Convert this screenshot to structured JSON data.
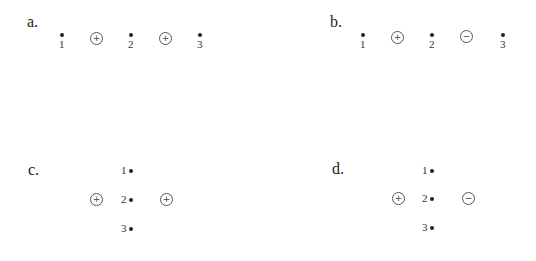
{
  "panels": {
    "a": {
      "label": "a.",
      "layout": "horizontal",
      "points": [
        "1",
        "2",
        "3"
      ],
      "charges": [
        {
          "sign": "+"
        },
        {
          "sign": "+"
        }
      ]
    },
    "b": {
      "label": "b.",
      "layout": "horizontal",
      "points": [
        "1",
        "2",
        "3"
      ],
      "charges": [
        {
          "sign": "+"
        },
        {
          "sign": "−"
        }
      ]
    },
    "c": {
      "label": "c.",
      "layout": "vertical",
      "points": [
        "1",
        "2",
        "3"
      ],
      "charges": [
        {
          "sign": "+"
        },
        {
          "sign": "+"
        }
      ]
    },
    "d": {
      "label": "d.",
      "layout": "vertical",
      "points": [
        "1",
        "2",
        "3"
      ],
      "charges": [
        {
          "sign": "+"
        },
        {
          "sign": "−"
        }
      ]
    }
  }
}
